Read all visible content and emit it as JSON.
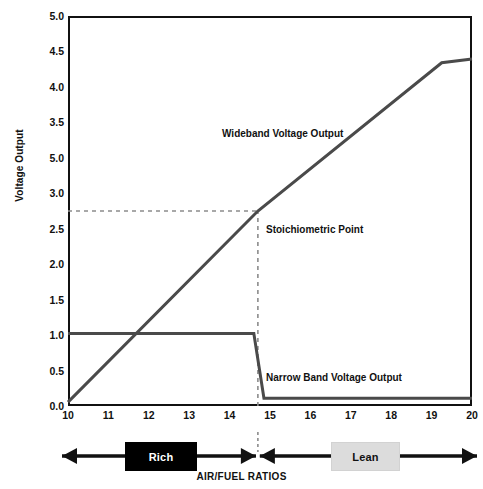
{
  "chart_data": {
    "type": "line",
    "title": "",
    "xlabel": "AIR/FUEL RATIOS",
    "ylabel": "Voltage Output",
    "xlim": [
      10,
      20
    ],
    "ylim": [
      0.0,
      5.0
    ],
    "grid": false,
    "legend_position": "inline-annotations",
    "x_ticks": [
      "10",
      "11",
      "12",
      "13",
      "14",
      "15",
      "16",
      "17",
      "18",
      "19",
      "20"
    ],
    "y_ticks": [
      "5.0",
      "4.5",
      "4.0",
      "3.5",
      "5.0",
      "3.0",
      "2.5",
      "2.0",
      "1.5",
      "1.0",
      "0.5",
      "0.0"
    ],
    "series": [
      {
        "name": "Wideband Voltage Output",
        "color": "#4a4a4a",
        "points": [
          {
            "x": 10.0,
            "y": 0.05
          },
          {
            "x": 14.7,
            "y": 2.5
          },
          {
            "x": 19.25,
            "y": 4.4
          },
          {
            "x": 20.0,
            "y": 4.45
          }
        ]
      },
      {
        "name": "Narrow Band Voltage Output",
        "color": "#4a4a4a",
        "points": [
          {
            "x": 10.0,
            "y": 0.93
          },
          {
            "x": 14.6,
            "y": 0.93
          },
          {
            "x": 14.85,
            "y": 0.1
          },
          {
            "x": 20.0,
            "y": 0.1
          }
        ]
      }
    ],
    "reference_lines": [
      {
        "name": "stoichiometric-horizontal",
        "orientation": "horizontal",
        "value": 2.5,
        "style": "dashed",
        "color": "#8c8c8c",
        "from_x": 10.0,
        "to_x": 14.7
      },
      {
        "name": "stoichiometric-vertical",
        "orientation": "vertical",
        "value": 14.7,
        "style": "dashed",
        "color": "#8c8c8c",
        "from_y": 0.0,
        "to_y": 2.5
      }
    ],
    "annotations": [
      {
        "name": "wideband-label",
        "text": "Wideband Voltage Output",
        "x": 14.0,
        "y": 3.35
      },
      {
        "name": "stoichiometric-label",
        "text": "Stoichiometric Point",
        "x": 15.0,
        "y": 2.45
      },
      {
        "name": "narrowband-label",
        "text": "Narrow Band Voltage Output",
        "x": 15.0,
        "y": 0.55
      }
    ]
  },
  "axis": {
    "y_title": "Voltage Output",
    "x_caption": "AIR/FUEL RATIOS"
  },
  "labels": {
    "wideband": "Wideband Voltage Output",
    "stoichiometric": "Stoichiometric Point",
    "narrowband": "Narrow Band Voltage Output"
  },
  "zones": {
    "rich": "Rich",
    "lean": "Lean"
  },
  "colors": {
    "line": "#4a4a4a",
    "dashed": "#8c8c8c",
    "axis": "#111111",
    "rich_bg": "#000000",
    "rich_fg": "#ffffff",
    "lean_bg": "#dcdcdc",
    "lean_fg": "#111111",
    "background": "#ffffff"
  }
}
